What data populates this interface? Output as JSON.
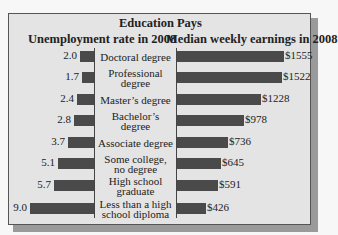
{
  "chart_data": {
    "type": "bar",
    "title": "Education Pays",
    "orientation": "horizontal",
    "categories": [
      "Doctoral degree",
      "Professional degree",
      "Master's degree",
      "Bachelor's degree",
      "Associate degree",
      "Some college, no degree",
      "High school graduate",
      "Less than a high school diploma"
    ],
    "series": [
      {
        "name": "Unemployment rate in 2008",
        "values": [
          2.0,
          1.7,
          2.4,
          2.8,
          3.7,
          5.1,
          5.7,
          9.0
        ],
        "labels": [
          "2.0",
          "1.7",
          "2.4",
          "2.8",
          "3.7",
          "5.1",
          "5.7",
          "9.0"
        ],
        "direction": "left"
      },
      {
        "name": "Median weekly earnings in 2008",
        "values": [
          1555,
          1522,
          1228,
          978,
          736,
          645,
          591,
          426
        ],
        "labels": [
          "$1555",
          "$1522",
          "$1228",
          "$978",
          "$736",
          "$645",
          "$591",
          "$426"
        ],
        "direction": "right"
      }
    ],
    "grid": false,
    "legend": "none",
    "bar_color": "#4a4a4a"
  },
  "header": {
    "title": "Education Pays",
    "left_subtitle": "Unemployment rate in 2008",
    "right_subtitle": "Median weekly earnings in 2008"
  },
  "rows": [
    {
      "category": "Doctoral degree",
      "unemployment": "2.0",
      "earnings": "$1555"
    },
    {
      "category": "Professional\ndegree",
      "unemployment": "1.7",
      "earnings": "$1522"
    },
    {
      "category": "Master’s degree",
      "unemployment": "2.4",
      "earnings": "$1228"
    },
    {
      "category": "Bachelor’s degree",
      "unemployment": "2.8",
      "earnings": "$978"
    },
    {
      "category": "Associate degree",
      "unemployment": "3.7",
      "earnings": "$736"
    },
    {
      "category": "Some college,\nno degree",
      "unemployment": "5.1",
      "earnings": "$645"
    },
    {
      "category": "High school\ngraduate",
      "unemployment": "5.7",
      "earnings": "$591"
    },
    {
      "category": "Less than a high\nschool diploma",
      "unemployment": "9.0",
      "earnings": "$426"
    }
  ]
}
